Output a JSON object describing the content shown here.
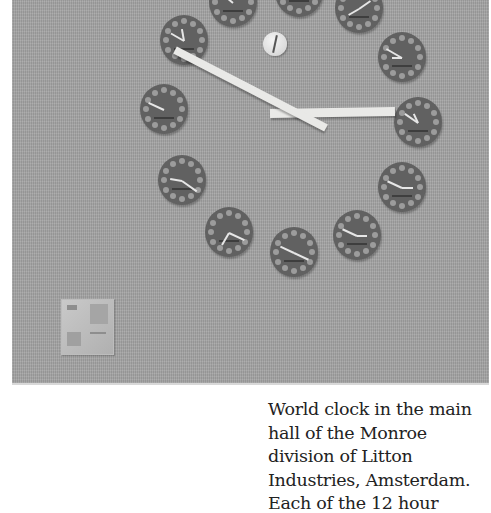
{
  "photo": {
    "subject": "world-clock-wall",
    "background_color": "#a3a3a3",
    "clock_face_color": "#616161",
    "hand_color": "#e9e9e7",
    "main_clock": {
      "minute_hand": {
        "x1": 175,
        "y1": 50,
        "x2": 326,
        "y2": 128
      },
      "hour_hand": {
        "x1": 270,
        "y1": 113,
        "x2": 395,
        "y2": 111
      }
    },
    "hour_clocks": [
      {
        "x": 233,
        "y": 2,
        "hands": [
          [
            -140,
            18
          ]
        ]
      },
      {
        "x": 299,
        "y": -8,
        "hands": [
          [
            30,
            12
          ]
        ]
      },
      {
        "x": 359,
        "y": 8,
        "hands": [
          [
            -35,
            14
          ],
          [
            150,
            12
          ]
        ]
      },
      {
        "x": 184,
        "y": 40,
        "hands": [
          [
            -150,
            15
          ],
          [
            -100,
            12
          ]
        ]
      },
      {
        "x": 402,
        "y": 57,
        "hands": [
          [
            -150,
            18
          ],
          [
            180,
            10
          ]
        ]
      },
      {
        "x": 164,
        "y": 109,
        "hands": [
          [
            -155,
            17
          ]
        ]
      },
      {
        "x": 418,
        "y": 122,
        "hands": [
          [
            -145,
            16
          ],
          [
            -115,
            10
          ]
        ]
      },
      {
        "x": 182,
        "y": 180,
        "hands": [
          [
            -170,
            12
          ],
          [
            35,
            18
          ]
        ]
      },
      {
        "x": 402,
        "y": 187,
        "hands": [
          [
            -155,
            16
          ],
          [
            0,
            11
          ]
        ]
      },
      {
        "x": 229,
        "y": 232,
        "hands": [
          [
            25,
            17
          ],
          [
            120,
            14
          ]
        ]
      },
      {
        "x": 294,
        "y": 252,
        "hands": [
          [
            -155,
            15
          ],
          [
            25,
            16
          ]
        ]
      },
      {
        "x": 357,
        "y": 235,
        "hands": [
          [
            -155,
            16
          ],
          [
            0,
            10
          ]
        ]
      }
    ]
  },
  "caption": {
    "lines": [
      "World clock in the main",
      "hall of the Monroe",
      "division of Litton",
      "Industries, Amsterdam.",
      "Each of the 12 hour"
    ]
  }
}
